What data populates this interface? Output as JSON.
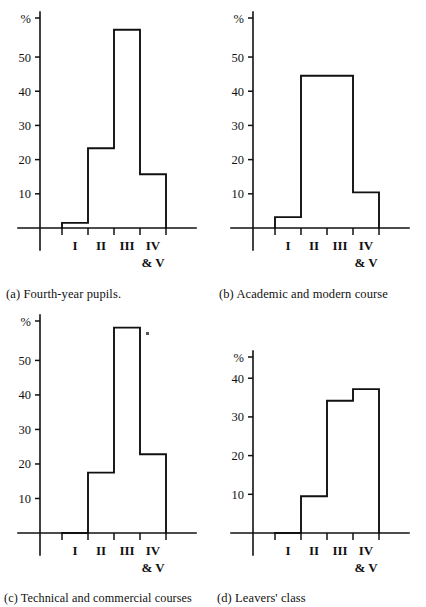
{
  "figure": {
    "kind": "multi-panel-histogram-figure",
    "panel_count": 4,
    "shared_categories": [
      "I",
      "II",
      "III",
      "IV\n& V"
    ],
    "shared_y_unit": "%"
  },
  "charts": [
    {
      "key": "a",
      "caption": "(a) Fourth-year pupils.",
      "axis_unit_label": "%",
      "categories": [
        "I",
        "II",
        "III",
        "IV",
        "& V"
      ],
      "category_labels": [
        "I",
        "II",
        "III",
        "IV"
      ],
      "category_sublabel": "& V",
      "values": [
        1.5,
        23.3,
        58,
        15.7
      ],
      "yticks": [
        10,
        20,
        30,
        40,
        50
      ],
      "ytick_labels": [
        "10",
        "20",
        "30",
        "40",
        "50"
      ],
      "ylim": [
        0,
        62
      ]
    },
    {
      "key": "b",
      "caption": "(b) Academic and modern course",
      "axis_unit_label": "%",
      "categories": [
        "I",
        "II",
        "III",
        "IV",
        "& V"
      ],
      "category_labels": [
        "I",
        "II",
        "III",
        "IV"
      ],
      "category_sublabel": "& V",
      "values": [
        3.2,
        44.5,
        44.5,
        10.4
      ],
      "yticks": [
        10,
        20,
        30,
        40,
        50
      ],
      "ytick_labels": [
        "10",
        "20",
        "30",
        "40",
        "50"
      ],
      "ylim": [
        0,
        62
      ]
    },
    {
      "key": "c",
      "caption": "(c) Technical and commercial courses",
      "axis_unit_label": "%",
      "categories": [
        "I",
        "II",
        "III",
        "IV",
        "& V"
      ],
      "category_labels": [
        "I",
        "II",
        "III",
        "IV"
      ],
      "category_sublabel": "& V",
      "values": [
        0,
        17.5,
        59.5,
        22.8
      ],
      "yticks": [
        10,
        20,
        30,
        40,
        50
      ],
      "ytick_labels": [
        "10",
        "20",
        "30",
        "40",
        "50"
      ],
      "ylim": [
        0,
        62
      ]
    },
    {
      "key": "d",
      "caption": "(d) Leavers' class",
      "axis_unit_label": "%",
      "categories": [
        "I",
        "II",
        "III",
        "IV",
        "& V"
      ],
      "category_labels": [
        "I",
        "II",
        "III",
        "IV"
      ],
      "category_sublabel": "& V",
      "values": [
        0,
        9.5,
        34.2,
        37.2
      ],
      "yticks": [
        10,
        20,
        30,
        40
      ],
      "ytick_labels": [
        "10",
        "20",
        "30",
        "40"
      ],
      "ylim": [
        0,
        46
      ]
    }
  ],
  "chart_data": [
    {
      "type": "bar",
      "title": "(a) Fourth-year pupils.",
      "categories": [
        "I",
        "II",
        "III",
        "IV & V"
      ],
      "values": [
        1.5,
        23.3,
        58,
        15.7
      ],
      "xlabel": "",
      "ylabel": "%",
      "ylim": [
        0,
        62
      ],
      "yticks": [
        10,
        20,
        30,
        40,
        50
      ],
      "grid": false,
      "legend": "none"
    },
    {
      "type": "bar",
      "title": "(b) Academic and modern course",
      "categories": [
        "I",
        "II",
        "III",
        "IV & V"
      ],
      "values": [
        3.2,
        44.5,
        44.5,
        10.4
      ],
      "xlabel": "",
      "ylabel": "%",
      "ylim": [
        0,
        62
      ],
      "yticks": [
        10,
        20,
        30,
        40,
        50
      ],
      "grid": false,
      "legend": "none"
    },
    {
      "type": "bar",
      "title": "(c) Technical and commercial courses",
      "categories": [
        "I",
        "II",
        "III",
        "IV & V"
      ],
      "values": [
        0,
        17.5,
        59.5,
        22.8
      ],
      "xlabel": "",
      "ylabel": "%",
      "ylim": [
        0,
        62
      ],
      "yticks": [
        10,
        20,
        30,
        40,
        50
      ],
      "grid": false,
      "legend": "none"
    },
    {
      "type": "bar",
      "title": "(d) Leavers' class",
      "categories": [
        "I",
        "II",
        "III",
        "IV & V"
      ],
      "values": [
        0,
        9.5,
        34.2,
        37.2
      ],
      "xlabel": "",
      "ylabel": "%",
      "ylim": [
        0,
        46
      ],
      "yticks": [
        10,
        20,
        30,
        40
      ],
      "grid": false,
      "legend": "none"
    }
  ],
  "colors": {
    "ink": "#111111",
    "paper": "#ffffff"
  }
}
